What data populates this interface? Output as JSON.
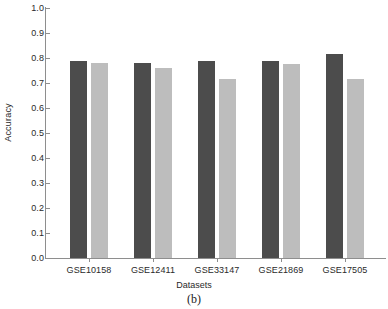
{
  "chart_data": {
    "type": "bar",
    "title": "",
    "caption": "(b)",
    "xlabel": "Datasets",
    "ylabel": "Accuracy",
    "categories": [
      "GSE10158",
      "GSE12411",
      "GSE33147",
      "GSE21869",
      "GSE17505"
    ],
    "series": [
      {
        "name": "series-1",
        "color": "#4c4c4c",
        "values": [
          0.79,
          0.78,
          0.789,
          0.788,
          0.815
        ]
      },
      {
        "name": "series-2",
        "color": "#bdbdbd",
        "values": [
          0.78,
          0.76,
          0.718,
          0.777,
          0.715
        ]
      }
    ],
    "ylim": [
      0.0,
      1.0
    ],
    "ytick_labels": [
      "1.0",
      "0.9",
      "0.8",
      "0.7",
      "0.6",
      "0.5",
      "0.4",
      "0.3",
      "0.2",
      "0.1",
      "0.0"
    ],
    "ytick_values": [
      1.0,
      0.9,
      0.8,
      0.7,
      0.6,
      0.5,
      0.4,
      0.3,
      0.2,
      0.1,
      0.0
    ],
    "grid": false,
    "legend": "none",
    "axis_color": "#8e8e8e",
    "background": "#ffffff"
  }
}
